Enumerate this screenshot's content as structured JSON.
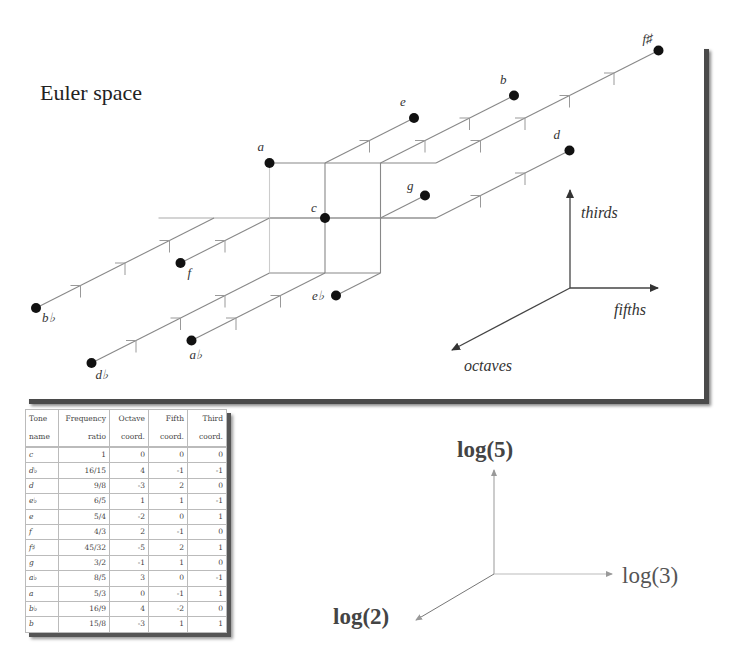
{
  "title": "Euler space",
  "lattice": {
    "origin_tone": "c",
    "origin_px": [
      325,
      218
    ],
    "step_fifth_px": [
      55.5,
      0
    ],
    "step_third_px": [
      0,
      -55
    ],
    "step_octave_px": [
      -44.5,
      22.5
    ]
  },
  "axes": {
    "thirds": "thirds",
    "fifths": "fifths",
    "octaves": "octaves"
  },
  "log_axes": {
    "up": "log(5)",
    "right": "log(3)",
    "down_left": "log(2)"
  },
  "table": {
    "headers": [
      {
        "top": "Tone",
        "bottom": "name"
      },
      {
        "top": "Frequency",
        "bottom": "ratio"
      },
      {
        "top": "Octave",
        "bottom": "coord."
      },
      {
        "top": "Fifth",
        "bottom": "coord."
      },
      {
        "top": "Third",
        "bottom": "coord."
      }
    ],
    "rows": [
      {
        "name": "c",
        "ratio": "1",
        "octave": "0",
        "fifth": "0",
        "third": "0"
      },
      {
        "name": "d♭",
        "ratio": "16/15",
        "octave": "4",
        "fifth": "-1",
        "third": "-1"
      },
      {
        "name": "d",
        "ratio": "9/8",
        "octave": "-3",
        "fifth": "2",
        "third": "0"
      },
      {
        "name": "e♭",
        "ratio": "6/5",
        "octave": "1",
        "fifth": "1",
        "third": "-1"
      },
      {
        "name": "e",
        "ratio": "5/4",
        "octave": "-2",
        "fifth": "0",
        "third": "1"
      },
      {
        "name": "f",
        "ratio": "4/3",
        "octave": "2",
        "fifth": "-1",
        "third": "0"
      },
      {
        "name": "f♯",
        "ratio": "45/32",
        "octave": "-5",
        "fifth": "2",
        "third": "1"
      },
      {
        "name": "g",
        "ratio": "3/2",
        "octave": "-1",
        "fifth": "1",
        "third": "0"
      },
      {
        "name": "a♭",
        "ratio": "8/5",
        "octave": "3",
        "fifth": "0",
        "third": "-1"
      },
      {
        "name": "a",
        "ratio": "5/3",
        "octave": "0",
        "fifth": "-1",
        "third": "1"
      },
      {
        "name": "b♭",
        "ratio": "16/9",
        "octave": "4",
        "fifth": "-2",
        "third": "0"
      },
      {
        "name": "b",
        "ratio": "15/8",
        "octave": "-3",
        "fifth": "1",
        "third": "1"
      }
    ]
  },
  "node_labels": {
    "c": "c",
    "d_flat": "d♭",
    "d": "d",
    "e_flat": "e♭",
    "e": "e",
    "f": "f",
    "f_sharp": "f♯",
    "g": "g",
    "a_flat": "a♭",
    "a": "a",
    "b_flat": "b♭",
    "b": "b"
  }
}
